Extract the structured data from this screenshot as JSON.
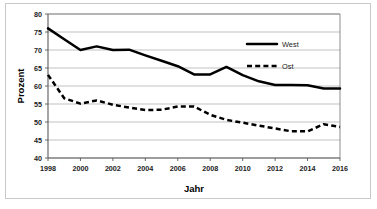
{
  "chart_data": {
    "type": "line",
    "title": "",
    "xlabel": "Jahr",
    "ylabel": "Prozent",
    "xlim": [
      1998,
      2016
    ],
    "ylim": [
      40,
      80
    ],
    "yticks": [
      40,
      45,
      50,
      55,
      60,
      65,
      70,
      75,
      80
    ],
    "xticks": [
      1998,
      2000,
      2002,
      2004,
      2006,
      2008,
      2010,
      2012,
      2014,
      2016
    ],
    "grid": "horizontal",
    "legend_position": "upper right",
    "x": [
      1998,
      1999,
      2000,
      2001,
      2002,
      2003,
      2004,
      2005,
      2006,
      2007,
      2008,
      2009,
      2010,
      2011,
      2012,
      2013,
      2014,
      2015,
      2016
    ],
    "series": [
      {
        "name": "West",
        "style": "solid",
        "color": "#000000",
        "values": [
          76.0,
          73.0,
          70.0,
          71.0,
          70.0,
          70.1,
          68.5,
          67.0,
          65.5,
          63.2,
          63.2,
          65.3,
          63.0,
          61.3,
          60.3,
          60.3,
          60.2,
          59.3,
          59.3
        ]
      },
      {
        "name": "Ost",
        "style": "dashed",
        "color": "#000000",
        "values": [
          63.1,
          56.6,
          55.1,
          56.0,
          54.8,
          54.0,
          53.3,
          53.4,
          54.3,
          54.3,
          52.0,
          50.6,
          49.8,
          49.0,
          48.2,
          47.4,
          47.4,
          49.4,
          48.6
        ]
      }
    ],
    "ytick_labels": [
      "40",
      "45",
      "50",
      "55",
      "60",
      "65",
      "70",
      "75",
      "80"
    ],
    "xtick_labels": [
      "1998",
      "2000",
      "2002",
      "2004",
      "2006",
      "2008",
      "2010",
      "2012",
      "2014",
      "2016"
    ],
    "legend_entries": [
      "West",
      "Ost"
    ]
  },
  "axis": {
    "y_title": "Prozent",
    "x_title": "Jahr"
  }
}
